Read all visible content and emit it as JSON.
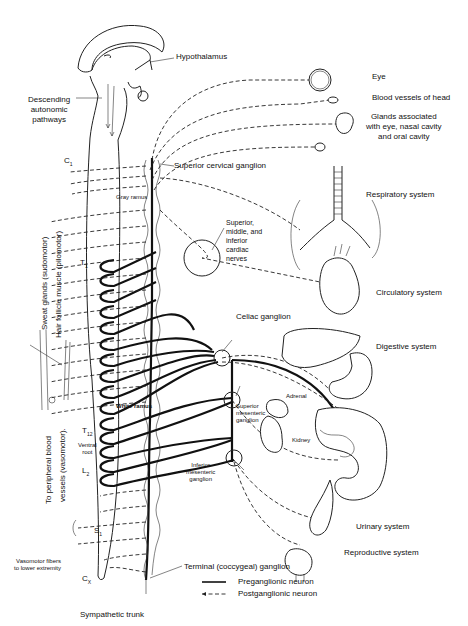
{
  "figure": {
    "labels": {
      "hypothalamus": "Hypothalamus",
      "descending": [
        "Descending",
        "autonomic",
        "pathways"
      ],
      "c1": "C",
      "c1_sub": "1",
      "t1": "T",
      "t1_sub": "1",
      "t12": "T",
      "t12_sub": "12",
      "l2": "L",
      "l2_sub": "2",
      "s1": "S",
      "s1_sub": "1",
      "cx": "C",
      "cx_sub": "X",
      "gray_ramus": "Gray ramus",
      "white_ramus": "White ramus",
      "ventral_root": [
        "Ventral",
        "root"
      ],
      "superior_cervical": "Superior cervical ganglion",
      "cardiac_nerves": [
        "Superior,",
        "middle, and",
        "inferior",
        "cardiac",
        "nerves"
      ],
      "celiac": "Celiac ganglion",
      "adrenal": "Adrenal",
      "kidney": "Kidney",
      "superior_mesenteric": [
        "Superior",
        "mesenteric",
        "ganglion"
      ],
      "inferior_mesenteric": [
        "Inferior",
        "mesenteric",
        "ganglion"
      ],
      "terminal": "Terminal (coccygeal) ganglion",
      "sympathetic_trunk": "Sympathetic trunk",
      "vasomotor_lower": [
        "Vasomotor fibers",
        "to lower extremity"
      ],
      "sweat_glands": "Sweat glands (sudomotor)",
      "hair_follicle": "Hair follicle muscle (pilomotor)",
      "peripheral_blood": "To peripheral blood",
      "vessels_vasomotor": "vessels (vasomotor)."
    },
    "targets": [
      {
        "label": [
          "Eye"
        ]
      },
      {
        "label": [
          "Blood vessels of head"
        ]
      },
      {
        "label": [
          "Glands associated",
          "with eye, nasal cavity",
          "and oral cavity"
        ]
      },
      {
        "label": [
          "Respiratory system"
        ]
      },
      {
        "label": [
          "Circulatory system"
        ]
      },
      {
        "label": [
          "Digestive system"
        ]
      },
      {
        "label": [
          "Urinary system"
        ]
      },
      {
        "label": [
          "Reproductive system"
        ]
      }
    ],
    "legend": [
      {
        "style": "solid",
        "label": "Preganglionic neuron"
      },
      {
        "style": "dashed",
        "label": "Postganglionic neuron"
      }
    ]
  }
}
